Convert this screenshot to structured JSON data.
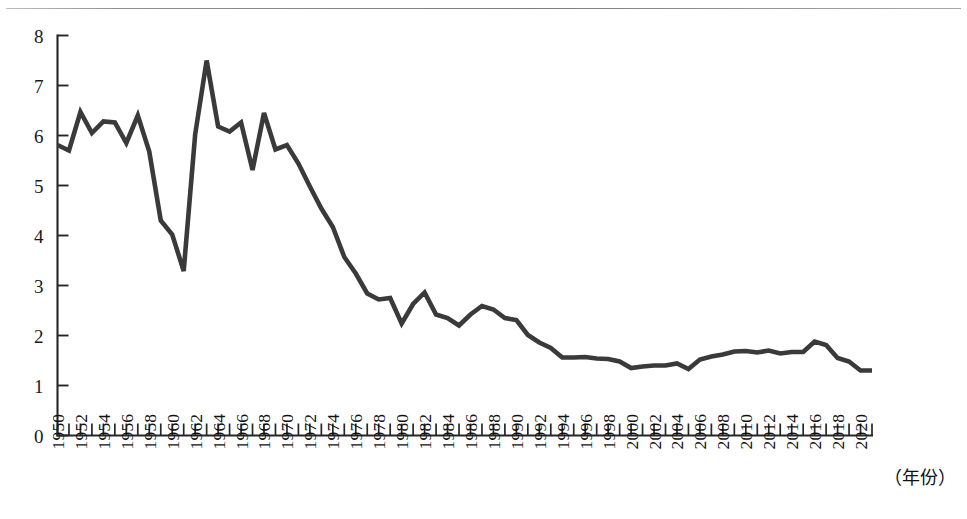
{
  "figure": {
    "background_color": "#ffffff",
    "line_color": "#3a3a3a",
    "axis_color": "#262626",
    "rule_color": "#8f8f8f",
    "x_caption": "（年份）"
  },
  "chart_data": {
    "type": "line",
    "title": "",
    "subtitle": "",
    "xlabel": "（年份）",
    "ylabel": "",
    "grid": false,
    "legend": null,
    "xlim": [
      1950,
      2021
    ],
    "ylim": [
      0,
      8
    ],
    "y_ticks": [
      0,
      1,
      2,
      3,
      4,
      5,
      6,
      7,
      8
    ],
    "y_tick_labels": [
      "0",
      "1",
      "2",
      "3",
      "4",
      "5",
      "6",
      "7",
      "8"
    ],
    "x_tick_labels": [
      "1950",
      "1952",
      "1954",
      "1956",
      "1958",
      "1960",
      "1962",
      "1964",
      "1966",
      "1968",
      "1970",
      "1972",
      "1974",
      "1976",
      "1978",
      "1980",
      "1982",
      "1984",
      "1986",
      "1988",
      "1990",
      "1992",
      "1994",
      "1996",
      "1998",
      "2000",
      "2002",
      "2004",
      "2006",
      "2008",
      "2010",
      "2012",
      "2014",
      "2016",
      "2018",
      "2020"
    ],
    "x": [
      1950,
      1951,
      1952,
      1953,
      1954,
      1955,
      1956,
      1957,
      1958,
      1959,
      1960,
      1961,
      1962,
      1963,
      1964,
      1965,
      1966,
      1967,
      1968,
      1969,
      1970,
      1971,
      1972,
      1973,
      1974,
      1975,
      1976,
      1977,
      1978,
      1979,
      1980,
      1981,
      1982,
      1983,
      1984,
      1985,
      1986,
      1987,
      1988,
      1989,
      1990,
      1991,
      1992,
      1993,
      1994,
      1995,
      1996,
      1997,
      1998,
      1999,
      2000,
      2001,
      2002,
      2003,
      2004,
      2005,
      2006,
      2007,
      2008,
      2009,
      2010,
      2011,
      2012,
      2013,
      2014,
      2015,
      2016,
      2017,
      2018,
      2019,
      2020,
      2021
    ],
    "values": [
      5.81,
      5.7,
      6.47,
      6.05,
      6.28,
      6.26,
      5.85,
      6.4,
      5.68,
      4.3,
      4.02,
      3.29,
      6.02,
      7.5,
      6.18,
      6.08,
      6.26,
      5.31,
      6.45,
      5.72,
      5.81,
      5.44,
      4.98,
      4.54,
      4.17,
      3.57,
      3.24,
      2.84,
      2.72,
      2.75,
      2.24,
      2.63,
      2.86,
      2.42,
      2.35,
      2.2,
      2.42,
      2.59,
      2.52,
      2.35,
      2.31,
      2.01,
      1.86,
      1.75,
      1.56,
      1.56,
      1.57,
      1.54,
      1.53,
      1.48,
      1.35,
      1.38,
      1.4,
      1.4,
      1.44,
      1.33,
      1.52,
      1.58,
      1.62,
      1.68,
      1.69,
      1.66,
      1.7,
      1.64,
      1.67,
      1.67,
      1.88,
      1.81,
      1.55,
      1.48,
      1.3,
      1.3
    ],
    "annotations": []
  }
}
